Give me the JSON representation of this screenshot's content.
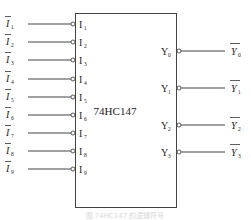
{
  "chip": {
    "name": "74HC147"
  },
  "inputs": [
    {
      "pin": "I",
      "sub": "1",
      "signal": "I",
      "signal_sub": "1"
    },
    {
      "pin": "I",
      "sub": "2",
      "signal": "I",
      "signal_sub": "2"
    },
    {
      "pin": "I",
      "sub": "3",
      "signal": "I",
      "signal_sub": "3"
    },
    {
      "pin": "I",
      "sub": "4",
      "signal": "I",
      "signal_sub": "4"
    },
    {
      "pin": "I",
      "sub": "5",
      "signal": "I",
      "signal_sub": "5"
    },
    {
      "pin": "I",
      "sub": "6",
      "signal": "I",
      "signal_sub": "6"
    },
    {
      "pin": "I",
      "sub": "7",
      "signal": "I",
      "signal_sub": "7"
    },
    {
      "pin": "I",
      "sub": "8",
      "signal": "I",
      "signal_sub": "8"
    },
    {
      "pin": "I",
      "sub": "9",
      "signal": "I",
      "signal_sub": "9"
    }
  ],
  "outputs": [
    {
      "pin": "Y",
      "sub": "0",
      "signal": "Y",
      "signal_sub": "0"
    },
    {
      "pin": "Y",
      "sub": "1",
      "signal": "Y",
      "signal_sub": "1"
    },
    {
      "pin": "Y",
      "sub": "2",
      "signal": "Y",
      "signal_sub": "2"
    },
    {
      "pin": "Y",
      "sub": "3",
      "signal": "Y",
      "signal_sub": "3"
    }
  ],
  "caption": "图  74HC147 的逻辑符号"
}
